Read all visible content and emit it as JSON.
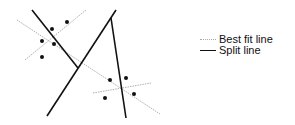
{
  "diagram": {
    "split_lines": [
      {
        "x1": 32,
        "y1": 10,
        "x2": 78,
        "y2": 68
      },
      {
        "x1": 47,
        "y1": 116,
        "x2": 116,
        "y2": 10
      },
      {
        "x1": 111,
        "y1": 18,
        "x2": 126,
        "y2": 118
      }
    ],
    "best_fit_lines": [
      {
        "x1": 17,
        "y1": 20,
        "x2": 160,
        "y2": 114
      },
      {
        "x1": 25,
        "y1": 60,
        "x2": 86,
        "y2": 10
      },
      {
        "x1": 93,
        "y1": 93,
        "x2": 151,
        "y2": 83
      }
    ],
    "points": [
      [
        52,
        29
      ],
      [
        67,
        22
      ],
      [
        42,
        41
      ],
      [
        54,
        44
      ],
      [
        42,
        57
      ],
      [
        110,
        80
      ],
      [
        126,
        78
      ],
      [
        134,
        94
      ],
      [
        105,
        98
      ]
    ],
    "colors": {
      "split": "#111111",
      "best_fit": "#b0b0b0",
      "point": "#111111"
    }
  },
  "legend": {
    "items": [
      {
        "label": "Best fit line",
        "style": "dotted-gray"
      },
      {
        "label": "Split line",
        "style": "solid-black"
      }
    ]
  }
}
